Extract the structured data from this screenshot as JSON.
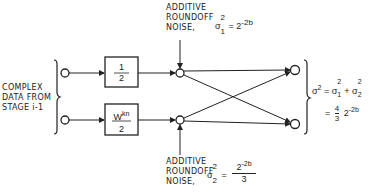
{
  "diagram": {
    "input_label": [
      "COMPLEX",
      "DATA FROM",
      "STAGE i-1"
    ],
    "top_noise": {
      "label": [
        "ADDITIVE",
        "ROUNDOFF",
        "NOISE,"
      ],
      "sigma": "σ",
      "sub": "1",
      "sup": "2",
      "rhs_base": "= 2",
      "rhs_exp": "-2b"
    },
    "bottom_noise": {
      "label": [
        "ADDITIVE",
        "ROUNDOFF",
        "NOISE,"
      ],
      "sigma": "σ",
      "sub": "2",
      "sup": "2",
      "eq": "=",
      "num_base": "2",
      "num_exp": "-2b",
      "den": "3"
    },
    "box_top": {
      "num": "1",
      "den": "2"
    },
    "box_bottom": {
      "num_base": "W",
      "num_exp": "kn",
      "den": "2"
    },
    "output_formula": {
      "line1": {
        "lhs": "σ",
        "lhs_sup": "2",
        "eq": "=",
        "t1": "σ",
        "t1_sub": "1",
        "t1_sup": "2",
        "plus": "+",
        "t2": "σ",
        "t2_sub": "2",
        "t2_sup": "2"
      },
      "line2": {
        "eq": "=",
        "num": "4",
        "den": "3",
        "base": "2",
        "exp": "-2b"
      }
    }
  }
}
